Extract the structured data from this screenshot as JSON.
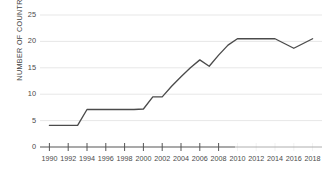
{
  "chart_data": {
    "type": "line",
    "title": "",
    "subtitle": "",
    "xlabel": "",
    "ylabel": "NUMBER OF COUNTRIES",
    "xlim": [
      1989,
      2019
    ],
    "ylim": [
      0,
      25
    ],
    "grid": true,
    "legend": "none",
    "y_ticks": [
      0,
      5,
      10,
      15,
      20,
      25
    ],
    "y_tick_labels": [
      "0",
      "5",
      "10",
      "15",
      "20",
      "25"
    ],
    "x_ticks": [
      1990,
      1992,
      1994,
      1996,
      1998,
      2000,
      2002,
      2004,
      2006,
      2008,
      2010,
      2012,
      2014,
      2016,
      2018
    ],
    "x_tick_labels": [
      "1990",
      "1992",
      "1994",
      "1996",
      "1998",
      "2000",
      "2002",
      "2004",
      "2006",
      "2008",
      "2010",
      "2012",
      "2014",
      "2016",
      "2018"
    ],
    "series": [
      {
        "name": "Number of countries",
        "color": "#4b4b4b",
        "x": [
          1990,
          1991,
          1992,
          1993,
          1994,
          1995,
          1996,
          1997,
          1998,
          1999,
          2000,
          2001,
          2002,
          2003,
          2004,
          2005,
          2006,
          2007,
          2008,
          2009,
          2010,
          2011,
          2012,
          2013,
          2014,
          2015,
          2016,
          2017,
          2018
        ],
        "values": [
          4.1,
          4.1,
          4.1,
          4.1,
          7.1,
          7.1,
          7.1,
          7.1,
          7.1,
          7.1,
          7.2,
          9.5,
          9.5,
          11.5,
          13.3,
          15.0,
          16.5,
          15.3,
          17.4,
          19.3,
          20.5,
          20.5,
          20.5,
          20.5,
          20.5,
          19.6,
          18.7,
          19.6,
          20.5
        ]
      }
    ]
  },
  "axis": {
    "y_title": "NUMBER OF COUNTRIES"
  }
}
